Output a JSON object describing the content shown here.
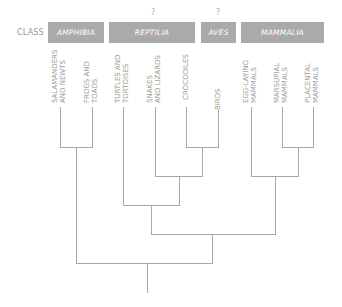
{
  "header": {
    "row_label": "CLASS",
    "classes": [
      {
        "name": "AMPHIBIA",
        "uncertain": false,
        "question_mark": ""
      },
      {
        "name": "REPTILIA",
        "uncertain": true,
        "question_mark": "?"
      },
      {
        "name": "AVES",
        "uncertain": true,
        "question_mark": "?"
      },
      {
        "name": "MAMMALIA",
        "uncertain": false,
        "question_mark": ""
      }
    ]
  },
  "leaves": [
    {
      "line1": "SALAMANDERS",
      "line2": "AND NEWTS",
      "class": "AMPHIBIA"
    },
    {
      "line1": "FROGS AND",
      "line2": "TOADS",
      "class": "AMPHIBIA"
    },
    {
      "line1": "TURTLES AND",
      "line2": "TORTOISES",
      "class": "REPTILIA"
    },
    {
      "line1": "SNAKES",
      "line2": "AND LIZARDS",
      "class": "REPTILIA"
    },
    {
      "line1": "CROCODILES",
      "line2": "",
      "class": "REPTILIA"
    },
    {
      "line1": "BIRDS",
      "line2": "",
      "class": "AVES"
    },
    {
      "line1": "EGG-LAYING",
      "line2": "MAMMALS",
      "class": "MAMMALIA"
    },
    {
      "line1": "MARSUPIAL",
      "line2": "MAMMALS",
      "class": "MAMMALIA"
    },
    {
      "line1": "PLACENTAL",
      "line2": "MAMMALS",
      "class": "MAMMALIA"
    }
  ],
  "tree": {
    "structure": "((Salamanders and newts, Frogs and toads), ((Turtles and tortoises, (Snakes and lizards, (Crocodiles, Birds))), (Egg-laying mammals, (Marsupial mammals, Placental mammals))))"
  },
  "colors": {
    "box_fill": "#aaaaaa",
    "box_text": "#ffffff",
    "line": "#a8a8a8",
    "text": "#9a9a9a"
  }
}
